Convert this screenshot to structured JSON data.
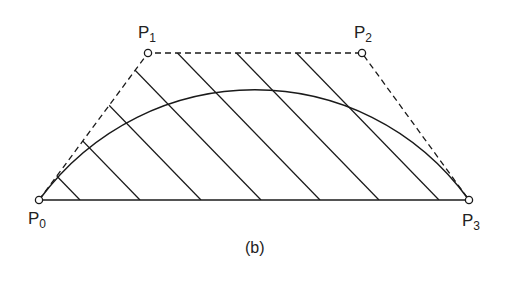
{
  "figure": {
    "caption": "(b)",
    "control_points": [
      {
        "name": "P",
        "sub": "0",
        "x": 39,
        "y": 200
      },
      {
        "name": "P",
        "sub": "1",
        "x": 148,
        "y": 53
      },
      {
        "name": "P",
        "sub": "2",
        "x": 362,
        "y": 53
      },
      {
        "name": "P",
        "sub": "3",
        "x": 469,
        "y": 200
      }
    ],
    "hatch_bottom_x": [
      80,
      140,
      201,
      261,
      320,
      379,
      439
    ],
    "colors": {
      "stroke": "#1a1a1a",
      "background": "#ffffff"
    }
  }
}
